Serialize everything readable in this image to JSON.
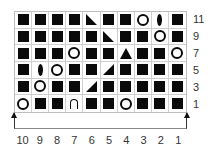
{
  "chart": {
    "columns": [
      "10",
      "9",
      "8",
      "7",
      "6",
      "5",
      "4",
      "3",
      "2",
      "1"
    ],
    "row_labels": [
      "11",
      "9",
      "7",
      "5",
      "3",
      "1"
    ],
    "legend_symbols": {
      "sq": "black-square",
      "yo": "open-circle",
      "leaf": "vertical-ellipse",
      "ssk": "right-triangle-left-lean",
      "k2tog": "right-triangle-right-lean",
      "dec3": "filled-triangle",
      "arch": "arch"
    },
    "rows": [
      {
        "label": "11",
        "cells": [
          "sq",
          "sq",
          "sq",
          "sq",
          "ssk",
          "sq",
          "sq",
          "yo",
          "leaf",
          "sq"
        ]
      },
      {
        "label": "9",
        "cells": [
          "sq",
          "sq",
          "sq",
          "sq",
          "sq",
          "ssk",
          "sq",
          "sq",
          "yo",
          "sq"
        ]
      },
      {
        "label": "7",
        "cells": [
          "sq",
          "sq",
          "sq",
          "yo",
          "sq",
          "sq",
          "dec3",
          "sq",
          "sq",
          "yo"
        ]
      },
      {
        "label": "5",
        "cells": [
          "sq",
          "leaf",
          "yo",
          "sq",
          "sq",
          "k2tog",
          "sq",
          "sq",
          "sq",
          "sq"
        ]
      },
      {
        "label": "3",
        "cells": [
          "sq",
          "yo",
          "sq",
          "sq",
          "k2tog",
          "sq",
          "sq",
          "sq",
          "sq",
          "sq"
        ]
      },
      {
        "label": "1",
        "cells": [
          "yo",
          "sq",
          "sq",
          "arch",
          "sq",
          "sq",
          "yo",
          "sq",
          "sq",
          "sq"
        ]
      }
    ],
    "colors": {
      "symbol": "#0a0a0a",
      "grid": "#cfcfcf",
      "text": "#333333"
    }
  }
}
